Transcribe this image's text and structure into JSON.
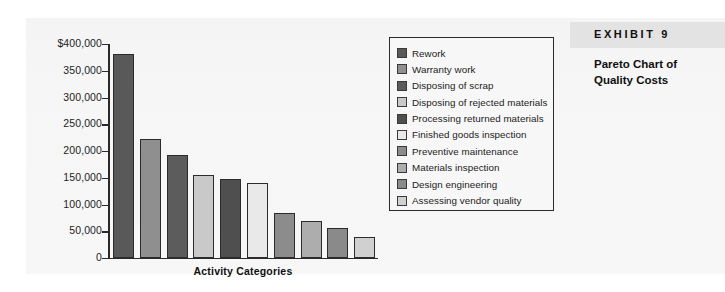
{
  "exhibit": {
    "label": "EXHIBIT 9",
    "title": "Pareto Chart of\nQuality Costs",
    "band_color": "#e3e3e3"
  },
  "chart_data": {
    "type": "bar",
    "xlabel": "Activity Categories",
    "ylabel": "",
    "ylim": [
      0,
      400000
    ],
    "grid": false,
    "legend_position": "right",
    "ytick_labels": [
      "$400,000",
      "350,000",
      "300,000",
      "250,000",
      "200,000",
      "150,000",
      "100,000",
      "50,000",
      "0"
    ],
    "ytick_values": [
      400000,
      350000,
      300000,
      250000,
      200000,
      150000,
      100000,
      50000,
      0
    ],
    "categories": [
      "Rework",
      "Warranty work",
      "Disposing of scrap",
      "Disposing of rejected materials",
      "Processing returned materials",
      "Finished goods inspection",
      "Preventive maintenance",
      "Materials inspection",
      "Design engineering",
      "Assessing vendor quality"
    ],
    "values": [
      381000,
      222000,
      192000,
      156000,
      148000,
      140000,
      85000,
      69000,
      57000,
      40000
    ],
    "colors": [
      "#595959",
      "#8f8f8f",
      "#5c5c5c",
      "#c9c9c9",
      "#4f4f4f",
      "#e9e9e9",
      "#8c8c8c",
      "#adadad",
      "#8a8a8a",
      "#d0d0d0"
    ]
  }
}
